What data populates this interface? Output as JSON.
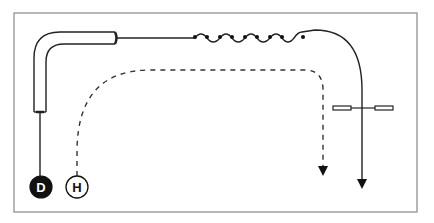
{
  "diagram": {
    "frame": {
      "x": 14,
      "y": 13,
      "width": 403,
      "height": 199,
      "stroke": "#777777"
    },
    "nodes": [
      {
        "id": "D",
        "label": "D",
        "style": "filled",
        "cx": 41,
        "cy": 187,
        "r": 11,
        "fill": "#111111",
        "text_color": "#ffffff"
      },
      {
        "id": "H",
        "label": "H",
        "style": "outline",
        "cx": 77,
        "cy": 187,
        "r": 11,
        "fill": "#ffffff",
        "text_color": "#111111"
      }
    ],
    "paths": [
      {
        "id": "solid-path",
        "from": "D",
        "style": "solid",
        "description": "bent pipe then wire, coil, curve down with crossbar, arrow"
      },
      {
        "id": "dashed-path",
        "from": "H",
        "style": "dashed",
        "description": "dashed curve to right then down with arrow"
      }
    ],
    "colors": {
      "line": "#222222",
      "frame": "#777777",
      "background": "#ffffff"
    }
  }
}
